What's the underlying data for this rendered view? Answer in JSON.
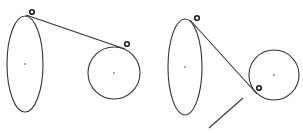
{
  "canvas": {
    "width": 303,
    "height": 133,
    "background": "#ffffff",
    "stroke_color": "#333333"
  },
  "figures": [
    {
      "name": "left-figure",
      "ellipse": {
        "cx": 25,
        "cy": 64,
        "rx": 18,
        "ry": 48
      },
      "circle": {
        "cx": 114,
        "cy": 73,
        "r": 26
      },
      "tangent_line": {
        "x1": 26,
        "y1": 15,
        "x2": 125,
        "y2": 49
      },
      "markers": [
        {
          "cx": 32,
          "cy": 12,
          "r": 2.3
        },
        {
          "cx": 127,
          "cy": 44,
          "r": 2.3
        }
      ]
    },
    {
      "name": "right-figure",
      "ellipse": {
        "cx": 185,
        "cy": 67,
        "rx": 17,
        "ry": 48
      },
      "circle": {
        "cx": 274,
        "cy": 75,
        "r": 25
      },
      "tangent_line": {
        "x1": 190,
        "y1": 20,
        "x2": 257,
        "y2": 94
      },
      "markers": [
        {
          "cx": 197,
          "cy": 18,
          "r": 2.3
        },
        {
          "cx": 259,
          "cy": 88,
          "r": 2.3
        }
      ],
      "extra_line": {
        "x1": 243,
        "y1": 98,
        "x2": 209,
        "y2": 128
      }
    }
  ]
}
